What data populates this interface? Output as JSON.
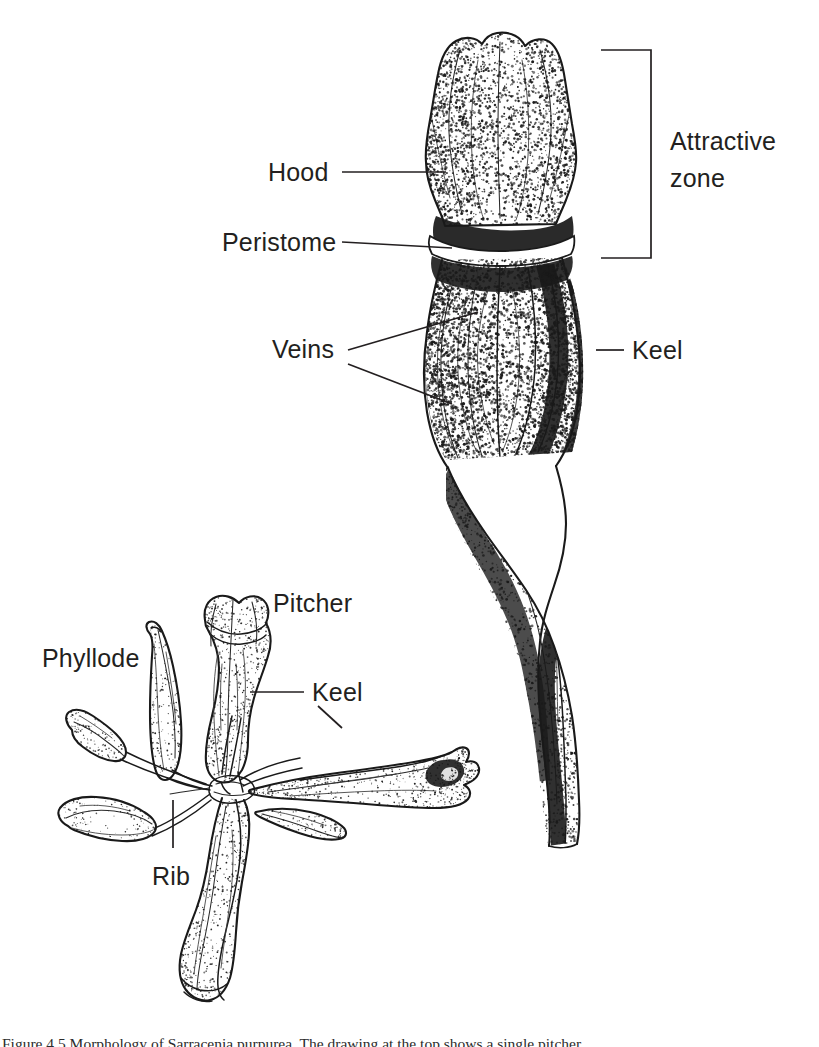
{
  "figure": {
    "kind": "botanical-line-drawing",
    "background_color": "#ffffff",
    "ink_color": "#1a1a1a",
    "text_color": "#231f20"
  },
  "labels": {
    "hood": "Hood",
    "peristome": "Peristome",
    "attractive_zone_line1": "Attractive",
    "attractive_zone_line2": "zone",
    "veins": "Veins",
    "keel_upper": "Keel",
    "pitcher": "Pitcher",
    "phyllode": "Phyllode",
    "keel_lower": "Keel",
    "rib": "Rib"
  },
  "caption": {
    "text": "Figure 4.5 Morphology of Sarracenia purpurea. The drawing at the top shows a single pitcher."
  }
}
